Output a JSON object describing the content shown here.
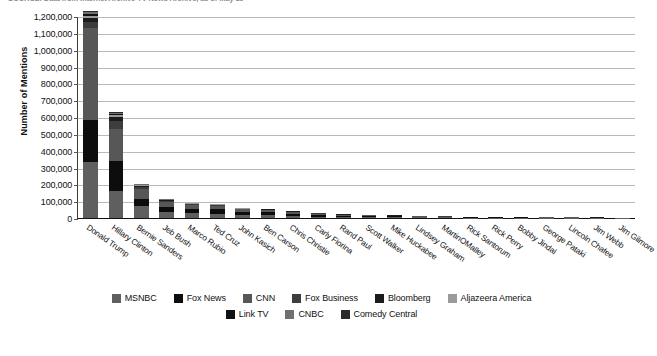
{
  "source_note": "SOURCE: Data from Internet Archive TV News Archive, as of May 19",
  "chart_data": {
    "type": "bar",
    "subtype": "stacked-vertical",
    "title": "",
    "xlabel": "",
    "ylabel": "Number of Mentions",
    "ylim": [
      0,
      1200000
    ],
    "ytick_step": 100000,
    "ytick_labels": [
      "0",
      "100,000",
      "200,000",
      "300,000",
      "400,000",
      "500,000",
      "600,000",
      "700,000",
      "800,000",
      "900,000",
      "1,000,000",
      "1,100,000",
      "1,200,000"
    ],
    "ytick_values": [
      0,
      100000,
      200000,
      300000,
      400000,
      500000,
      600000,
      700000,
      800000,
      900000,
      1000000,
      1100000,
      1200000
    ],
    "grid": true,
    "legend_position": "bottom",
    "categories": [
      "Donald Trump",
      "Hillary Clinton",
      "Bernie Sanders",
      "Jeb Bush",
      "Marco Rubio",
      "Ted Cruz",
      "John Kasich",
      "Ben Carson",
      "Chris Christie",
      "Carly Fiorina",
      "Rand Paul",
      "Scott Walker",
      "Mike Huckabee",
      "Lindsey Graham",
      "MartinOMalley",
      "Rick Santorum",
      "Rick Perry",
      "Bobby Jindal",
      "George Pataki",
      "Lincoln Chafee",
      "Jim Webb",
      "Jim Gilmore"
    ],
    "series": [
      {
        "name": "MSNBC",
        "color": "#5f5f5f",
        "values": [
          330000,
          158000,
          70000,
          34000,
          27000,
          26000,
          18000,
          16000,
          13000,
          9000,
          7000,
          6500,
          5000,
          4200,
          3600,
          2600,
          2200,
          1800,
          1500,
          1300,
          1100,
          800
        ]
      },
      {
        "name": "Fox News",
        "color": "#0d0d0d",
        "values": [
          250000,
          182000,
          42000,
          33000,
          26000,
          25000,
          17000,
          17000,
          12000,
          9500,
          6500,
          6000,
          4800,
          4000,
          2400,
          2400,
          2000,
          1700,
          1400,
          1200,
          1000,
          750
        ]
      },
      {
        "name": "CNN",
        "color": "#575757",
        "values": [
          550000,
          190000,
          58000,
          30000,
          25000,
          22000,
          16000,
          14000,
          11000,
          8000,
          6000,
          5500,
          4300,
          3500,
          2600,
          2200,
          1800,
          1500,
          1200,
          1100,
          900,
          700
        ]
      },
      {
        "name": "Fox Business",
        "color": "#3d3d3d",
        "values": [
          35000,
          46000,
          13000,
          6000,
          5000,
          4500,
          3500,
          3000,
          2400,
          1700,
          1300,
          1200,
          950,
          800,
          600,
          500,
          420,
          350,
          300,
          260,
          220,
          170
        ]
      },
      {
        "name": "Bloomberg",
        "color": "#1c1c1c",
        "values": [
          22000,
          24000,
          7000,
          3500,
          3000,
          2600,
          2000,
          1700,
          1400,
          1000,
          800,
          700,
          560,
          470,
          360,
          300,
          250,
          210,
          180,
          150,
          130,
          100
        ]
      },
      {
        "name": "Aljazeera America",
        "color": "#9a9a9a",
        "values": [
          14000,
          11000,
          4000,
          2000,
          1700,
          1500,
          1150,
          950,
          800,
          580,
          450,
          400,
          320,
          270,
          210,
          175,
          145,
          120,
          100,
          88,
          75,
          58
        ]
      },
      {
        "name": "Link TV",
        "color": "#111111",
        "values": [
          9000,
          6000,
          2300,
          1200,
          1000,
          900,
          700,
          580,
          480,
          350,
          270,
          240,
          190,
          160,
          125,
          105,
          88,
          72,
          60,
          52,
          45,
          35
        ]
      },
      {
        "name": "CNBC",
        "color": "#707070",
        "values": [
          13000,
          8000,
          3200,
          1600,
          1350,
          1200,
          930,
          780,
          640,
          470,
          360,
          320,
          255,
          215,
          168,
          140,
          116,
          96,
          80,
          70,
          60,
          47
        ]
      },
      {
        "name": "Comedy Central",
        "color": "#2a2a2a",
        "values": [
          7000,
          5000,
          1800,
          950,
          800,
          700,
          540,
          450,
          370,
          270,
          210,
          185,
          148,
          124,
          97,
          81,
          67,
          56,
          46,
          40,
          35,
          27
        ]
      }
    ]
  },
  "legend": {
    "row1": [
      {
        "label": "MSNBC",
        "color": "#5f5f5f"
      },
      {
        "label": "Fox News",
        "color": "#0d0d0d"
      },
      {
        "label": "CNN",
        "color": "#575757"
      },
      {
        "label": "Fox Business",
        "color": "#3d3d3d"
      },
      {
        "label": "Bloomberg",
        "color": "#1c1c1c"
      },
      {
        "label": "Aljazeera America",
        "color": "#9a9a9a"
      }
    ],
    "row2": [
      {
        "label": "Link TV",
        "color": "#111111"
      },
      {
        "label": "CNBC",
        "color": "#707070"
      },
      {
        "label": "Comedy Central",
        "color": "#2a2a2a"
      }
    ]
  }
}
